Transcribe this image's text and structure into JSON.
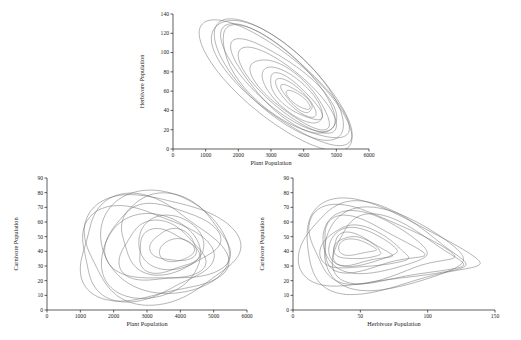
{
  "page": {
    "background": "#ffffff"
  },
  "style": {
    "trajectory_color": "#6a6a6a",
    "axis_color": "#1a1a1a",
    "tick_label_color": "#222222",
    "axis_title_color": "#222222"
  },
  "loop_format": "each loop entry is [scale, dx, dy, phase, wobble_amp, wobble_freq, wobble_phase]",
  "chart_data": [
    {
      "id": "plant-herbivore",
      "type": "line",
      "subtype": "phase-portrait",
      "title": "",
      "xlabel": "Plant Population",
      "ylabel": "Herbivore Population",
      "xlim": [
        0,
        6000
      ],
      "ylim": [
        0,
        140
      ],
      "xticks": [
        0,
        1000,
        2000,
        3000,
        4000,
        5000,
        6000
      ],
      "yticks": [
        0,
        20,
        40,
        60,
        80,
        100,
        120,
        140
      ],
      "grid": false,
      "legend": "none",
      "shape": {
        "cx": 3300,
        "cy": 70,
        "a": 2600,
        "b": 97,
        "e": 0.35,
        "rot": -0.65,
        "q": 0,
        "slope": 0,
        "bend": 0
      },
      "loops": [
        [
          1.04,
          -160,
          -4,
          0.0,
          0.05,
          2,
          1.0
        ],
        [
          1.0,
          0,
          0,
          0.3,
          0.04,
          3,
          2.0
        ],
        [
          0.97,
          -60,
          2,
          0.9,
          0.05,
          2,
          4.0
        ],
        [
          0.9,
          60,
          -2,
          1.5,
          0.06,
          3,
          0.5
        ],
        [
          0.83,
          -90,
          4,
          2.2,
          0.05,
          2,
          3.0
        ],
        [
          0.75,
          130,
          -6,
          2.9,
          0.06,
          3,
          5.0
        ],
        [
          0.66,
          200,
          -9,
          3.5,
          0.07,
          2,
          1.5
        ],
        [
          0.56,
          280,
          -12,
          4.1,
          0.06,
          3,
          2.5
        ],
        [
          0.46,
          350,
          -14,
          4.8,
          0.07,
          2,
          4.5
        ],
        [
          0.37,
          420,
          -16,
          5.4,
          0.08,
          3,
          0.8
        ],
        [
          0.29,
          460,
          -17,
          6.0,
          0.08,
          2,
          2.8
        ],
        [
          0.22,
          500,
          -18,
          0.6,
          0.09,
          3,
          4.8
        ],
        [
          0.16,
          530,
          -19,
          1.2,
          0.1,
          2,
          0.2
        ]
      ]
    },
    {
      "id": "plant-carnivore",
      "type": "line",
      "subtype": "phase-portrait",
      "title": "",
      "xlabel": "Plant Population",
      "ylabel": "Carnivore Population",
      "xlim": [
        0,
        6000
      ],
      "ylim": [
        0,
        90
      ],
      "xticks": [
        0,
        1000,
        2000,
        3000,
        4000,
        5000,
        6000
      ],
      "yticks": [
        0,
        10,
        20,
        30,
        40,
        50,
        60,
        70,
        80,
        90
      ],
      "grid": false,
      "legend": "none",
      "shape": {
        "cx": 3300,
        "cy": 43,
        "a": 2280,
        "b": 38,
        "e": 0.95,
        "rot": 0,
        "q": 0.12,
        "slope": -0.05,
        "bend": -0.06
      },
      "loops": [
        [
          1.0,
          80,
          0,
          0.0,
          0.1,
          3,
          0.5
        ],
        [
          0.95,
          -240,
          -2,
          0.7,
          0.12,
          3,
          2.2
        ],
        [
          0.9,
          240,
          3,
          1.4,
          0.09,
          2,
          4.0
        ],
        [
          0.85,
          -420,
          -4,
          2.1,
          0.11,
          3,
          1.1
        ],
        [
          0.8,
          340,
          5,
          2.8,
          0.1,
          3,
          3.3
        ],
        [
          0.72,
          -180,
          -6,
          3.5,
          0.12,
          2,
          5.2
        ],
        [
          0.64,
          330,
          6,
          4.2,
          0.1,
          3,
          0.9
        ],
        [
          0.55,
          140,
          -4,
          4.9,
          0.11,
          3,
          2.9
        ],
        [
          0.47,
          430,
          3,
          5.6,
          0.09,
          2,
          4.7
        ],
        [
          0.39,
          280,
          -3,
          0.3,
          0.12,
          3,
          1.7
        ],
        [
          0.3,
          520,
          1,
          1.0,
          0.1,
          3,
          3.9
        ],
        [
          0.22,
          600,
          -2,
          1.7,
          0.11,
          2,
          0.3
        ]
      ]
    },
    {
      "id": "herbivore-carnivore",
      "type": "line",
      "subtype": "phase-portrait",
      "title": "",
      "xlabel": "Herbivore Population",
      "ylabel": "Carnivore Population",
      "xlim": [
        0,
        150
      ],
      "ylim": [
        0,
        90
      ],
      "xticks": [
        0,
        50,
        100,
        150
      ],
      "yticks": [
        0,
        10,
        20,
        30,
        40,
        50,
        60,
        70,
        80,
        90
      ],
      "grid": false,
      "legend": "none",
      "shape": {
        "cx": 70,
        "cy": 42,
        "a": 64,
        "b": 27,
        "e": 1,
        "rot": 0,
        "q": 0.55,
        "slope": -0.2,
        "bend": -0.15
      },
      "loops": [
        [
          1.0,
          0,
          0,
          0.0,
          0.08,
          3,
          1.3
        ],
        [
          0.94,
          -4,
          1,
          0.6,
          0.1,
          3,
          3.1
        ],
        [
          0.88,
          5,
          -1,
          1.2,
          0.09,
          2,
          5.0
        ],
        [
          0.82,
          -7,
          2,
          1.9,
          0.11,
          3,
          0.7
        ],
        [
          0.74,
          6,
          -2,
          2.6,
          0.1,
          3,
          2.6
        ],
        [
          0.66,
          -9,
          3,
          3.2,
          0.09,
          2,
          4.4
        ],
        [
          0.58,
          -13,
          2,
          3.9,
          0.11,
          3,
          1.5
        ],
        [
          0.5,
          -16,
          0,
          4.5,
          0.1,
          3,
          3.6
        ],
        [
          0.42,
          -18,
          1,
          5.2,
          0.09,
          2,
          5.5
        ],
        [
          0.34,
          -20,
          -1,
          5.9,
          0.11,
          3,
          2.0
        ],
        [
          0.27,
          -21,
          0,
          0.4,
          0.1,
          3,
          4.2
        ],
        [
          0.2,
          -22,
          1,
          1.1,
          0.12,
          2,
          0.9
        ]
      ]
    }
  ]
}
